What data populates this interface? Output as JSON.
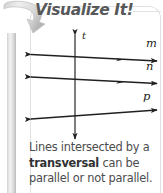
{
  "panel": {
    "title": "Visualize It!",
    "accent_color": "#57585a",
    "frame_color": "#e2e2e2",
    "pole_color": "#d8d8d8"
  },
  "icons": {
    "hook_arrow": "curved-arrow-icon"
  },
  "figure": {
    "type": "geometry-diagram",
    "transversal": {
      "label": "t",
      "orientation": "vertical",
      "arrowheads": "both-ends"
    },
    "lines": [
      {
        "label": "m",
        "arrowheads": "both-ends",
        "slope": "slightly-down-right",
        "parallel_group": 1
      },
      {
        "label": "n",
        "arrowheads": "both-ends",
        "slope": "slightly-down-right",
        "parallel_group": 1
      },
      {
        "label": "p",
        "arrowheads": "both-ends",
        "slope": "slightly-up-right",
        "parallel_group": 2
      }
    ],
    "stroke_color": "#231f20"
  },
  "caption": {
    "line1_pre": "Lines intersected by a",
    "term": "transversal",
    "line2_post": " can be",
    "line3": "parallel or not parallel."
  }
}
